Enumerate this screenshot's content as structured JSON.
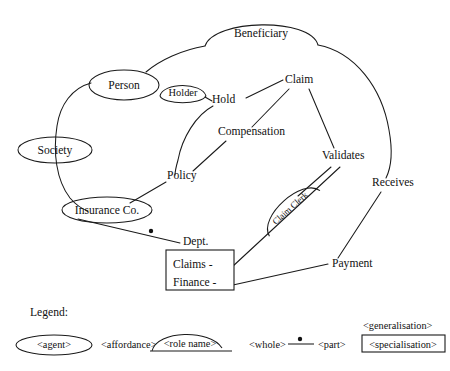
{
  "diagram": {
    "title_visible": false,
    "agents": [
      {
        "id": "person",
        "label": "Person",
        "cx": 124,
        "cy": 85,
        "rx": 35,
        "ry": 15
      },
      {
        "id": "society",
        "label": "Society",
        "cx": 55,
        "cy": 150,
        "rx": 37,
        "ry": 13
      },
      {
        "id": "insurance",
        "label": "Insurance Co.",
        "cx": 107,
        "cy": 210,
        "rx": 45,
        "ry": 13
      }
    ],
    "roles": [
      {
        "id": "beneficiary",
        "label": "Beneficiary",
        "x1": 205,
        "x2": 318,
        "y": 45,
        "lift": 30
      },
      {
        "id": "holder",
        "label": "Holder",
        "x1": 160,
        "x2": 206,
        "y": 97,
        "lift": 15
      },
      {
        "id": "claim-clerk",
        "label": "Claim Clerk",
        "x1": 262,
        "x2": 322,
        "y": 222,
        "lift": 20,
        "rotate": -41
      }
    ],
    "affordances": [
      {
        "id": "hold",
        "label": "Hold",
        "x": 212,
        "y": 103
      },
      {
        "id": "claim",
        "label": "Claim",
        "x": 285,
        "y": 83
      },
      {
        "id": "compensation",
        "label": "Compensation",
        "x": 218,
        "y": 135
      },
      {
        "id": "policy",
        "label": "Policy",
        "x": 167,
        "y": 179
      },
      {
        "id": "validates",
        "label": "Validates",
        "x": 322,
        "y": 159
      },
      {
        "id": "receives",
        "label": "Receives",
        "x": 372,
        "y": 186
      },
      {
        "id": "payment",
        "label": "Payment",
        "x": 332,
        "y": 267
      },
      {
        "id": "dept",
        "label": "Dept.",
        "x": 183,
        "y": 245
      }
    ],
    "specialisation_box": {
      "id": "dept-box",
      "x": 166,
      "y": 250,
      "w": 68,
      "h": 40,
      "items": [
        "Claims -",
        "Finance -"
      ]
    },
    "whole_part_dot": {
      "x": 151,
      "y": 231,
      "r": 2.2
    }
  },
  "legend": {
    "title": "Legend:",
    "agent": "<agent>",
    "affordance": "<affordance>",
    "role_name": "<role name>",
    "whole": "<whole>",
    "part": "<part>",
    "generalisation": "<generalisation>",
    "specialisation": "<specialisation>"
  },
  "colors": {
    "stroke": "#1a1a1a",
    "text": "#111111",
    "background": "#ffffff"
  }
}
